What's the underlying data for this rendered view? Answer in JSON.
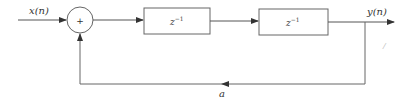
{
  "diagram": {
    "type": "block-diagram",
    "input_label": "x(n)",
    "output_label": "y(n)",
    "adder_symbol": "+",
    "blocks": [
      {
        "id": "delay1",
        "label_base": "z",
        "label_exp": "−1"
      },
      {
        "id": "delay2",
        "label_base": "z",
        "label_exp": "−1"
      }
    ],
    "feedback_gain_label": "a",
    "stray_mark": "/",
    "colors": {
      "stroke": "#555555",
      "text": "#333333",
      "background": "#ffffff"
    }
  }
}
